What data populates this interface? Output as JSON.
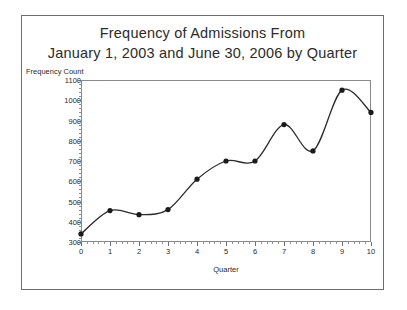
{
  "figure": {
    "title_lines": [
      "Frequency of Admissions From",
      "January 1, 2003 and June 30, 2006 by Quarter"
    ]
  },
  "chart_data": {
    "type": "line",
    "title": "Frequency of Admissions From January 1, 2003 and June 30, 2006 by Quarter",
    "xlabel": "Quarter",
    "ylabel": "Frequency Count",
    "x": [
      0,
      1,
      2,
      3,
      4,
      5,
      6,
      7,
      8,
      9,
      10
    ],
    "values": [
      340,
      455,
      435,
      460,
      610,
      700,
      700,
      880,
      750,
      1050,
      940
    ],
    "xlim": [
      0,
      10
    ],
    "ylim": [
      300,
      1100
    ],
    "xticks": [
      0,
      1,
      2,
      3,
      4,
      5,
      6,
      7,
      8,
      9,
      10
    ],
    "yticks": [
      300,
      400,
      500,
      600,
      700,
      800,
      900,
      1000,
      1100
    ],
    "xtick_labels": [
      "0",
      "1",
      "2",
      "3",
      "4",
      "5",
      "6",
      "7",
      "8",
      "9",
      "10"
    ],
    "ytick_labels": [
      "300",
      "400",
      "500",
      "600",
      "700",
      "800",
      "900",
      "1000",
      "1100"
    ],
    "grid": false,
    "legend": null,
    "marker": "filled-circle",
    "line_color": "#2b2b2b",
    "marker_color": "#1a1a1a",
    "smoothing": "spline"
  }
}
